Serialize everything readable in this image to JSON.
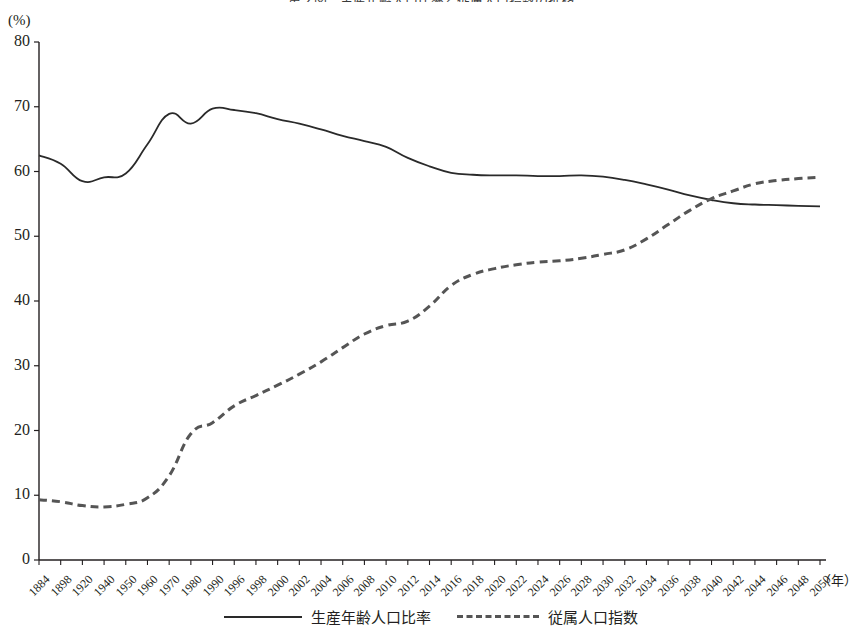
{
  "title": "第２図　生産年齢人口比率と従属人口指数の推移",
  "unit_label": "(%)",
  "x_axis_unit": "（年）",
  "legend": [
    {
      "key": "working_age_ratio",
      "label": "生産年齢人口比率",
      "style": "solid",
      "color": "#2a2a2a"
    },
    {
      "key": "dependency_index",
      "label": "従属人口指数",
      "style": "dashed",
      "color": "#555555"
    }
  ],
  "y_ticks": [
    "0",
    "10",
    "20",
    "30",
    "40",
    "50",
    "60",
    "70",
    "80"
  ],
  "x_ticks": [
    "1884",
    "1898",
    "1920",
    "1940",
    "1950",
    "1960",
    "1970",
    "1980",
    "1990",
    "1996",
    "1998",
    "2000",
    "2002",
    "2004",
    "2006",
    "2008",
    "2010",
    "2012",
    "2014",
    "2016",
    "2018",
    "2020",
    "2022",
    "2024",
    "2026",
    "2028",
    "2030",
    "2032",
    "2034",
    "2036",
    "2038",
    "2040",
    "2042",
    "2044",
    "2046",
    "2048",
    "2050"
  ],
  "chart_data": {
    "type": "line",
    "title": "第２図　生産年齢人口比率と従属人口指数の推移",
    "xlabel": "（年）",
    "ylabel": "(%)",
    "ylim": [
      0,
      80
    ],
    "ytick_step": 10,
    "grid": false,
    "legend_position": "bottom-center",
    "categories": [
      "1884",
      "1898",
      "1920",
      "1940",
      "1950",
      "1960",
      "1970",
      "1980",
      "1990",
      "1996",
      "1998",
      "2000",
      "2002",
      "2004",
      "2006",
      "2008",
      "2010",
      "2012",
      "2014",
      "2016",
      "2018",
      "2020",
      "2022",
      "2024",
      "2026",
      "2028",
      "2030",
      "2032",
      "2034",
      "2036",
      "2038",
      "2040",
      "2042",
      "2044",
      "2046",
      "2048",
      "2050"
    ],
    "series": [
      {
        "name": "生産年齢人口比率",
        "style": "solid",
        "color": "#2a2a2a",
        "values": [
          62.5,
          61.2,
          58.5,
          59.1,
          59.7,
          64.2,
          68.9,
          67.4,
          69.7,
          69.5,
          69.0,
          68.1,
          67.4,
          66.5,
          65.5,
          64.7,
          63.8,
          62.1,
          60.8,
          59.8,
          59.5,
          59.4,
          59.4,
          59.3,
          59.3,
          59.4,
          59.2,
          58.7,
          58.0,
          57.2,
          56.3,
          55.6,
          55.1,
          54.9,
          54.8,
          54.7,
          54.6
        ]
      },
      {
        "name": "従属人口指数",
        "style": "dashed",
        "color": "#555555",
        "values": [
          9.3,
          9.0,
          8.4,
          8.2,
          8.6,
          9.6,
          13.0,
          19.5,
          21.2,
          23.8,
          25.4,
          27.0,
          28.7,
          30.6,
          32.8,
          34.9,
          36.2,
          36.9,
          39.2,
          42.4,
          44.1,
          45.0,
          45.6,
          46.0,
          46.2,
          46.6,
          47.2,
          47.9,
          49.6,
          51.8,
          54.0,
          55.8,
          57.0,
          58.1,
          58.6,
          58.9,
          59.1
        ]
      }
    ]
  }
}
